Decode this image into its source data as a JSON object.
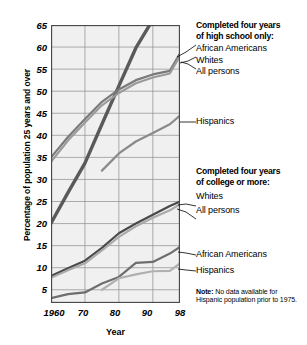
{
  "chart_data": {
    "type": "line",
    "title": "",
    "xlabel": "Year",
    "ylabel": "Percentage of population 25 years and over",
    "xlim": [
      1960,
      1998
    ],
    "ylim": [
      2,
      65
    ],
    "yticks": [
      5,
      10,
      15,
      20,
      25,
      30,
      35,
      40,
      45,
      50,
      55,
      60,
      65
    ],
    "ytick_labels": [
      "5",
      "10",
      "15",
      "20",
      "25",
      "30",
      "35",
      "40",
      "45",
      "50",
      "55",
      "60",
      "65"
    ],
    "xticks": [
      1960,
      1970,
      1980,
      1990,
      1998
    ],
    "xtick_labels": [
      "1960",
      "70",
      "80",
      "90",
      "98"
    ],
    "grid": true,
    "legend_position": "right",
    "groups": [
      {
        "heading": "Completed four years of high school only:",
        "series": [
          {
            "name": "African Americans",
            "color": "#5a5a5a",
            "x": [
              1960,
              1965,
              1970,
              1975,
              1980,
              1985,
              1990,
              1995,
              1998
            ],
            "y": [
              20.1,
              27.0,
              33.7,
              42.5,
              51.2,
              59.8,
              66.2,
              73.8,
              76.0
            ]
          },
          {
            "name": "Whites",
            "color": "#7a7a7a",
            "x": [
              1960,
              1965,
              1970,
              1975,
              1980,
              1985,
              1990,
              1995,
              1998
            ],
            "y": [
              35.0,
              39.6,
              43.7,
              47.6,
              50.4,
              52.5,
              53.8,
              54.6,
              58.6
            ]
          },
          {
            "name": "All persons",
            "color": "#9a9a9a",
            "x": [
              1960,
              1965,
              1970,
              1975,
              1980,
              1985,
              1990,
              1995,
              1998
            ],
            "y": [
              34.0,
              38.8,
              42.9,
              46.8,
              49.6,
              51.8,
              53.1,
              54.0,
              58.0
            ]
          },
          {
            "name": "Hispanics",
            "color": "#8a8a8a",
            "x": [
              1975,
              1980,
              1985,
              1990,
              1995,
              1998
            ],
            "y": [
              32.0,
              35.9,
              38.6,
              40.5,
              42.5,
              44.5
            ]
          }
        ]
      },
      {
        "heading": "Completed four years of college or more:",
        "series": [
          {
            "name": "Whites",
            "color": "#4a4a4a",
            "x": [
              1960,
              1965,
              1970,
              1975,
              1980,
              1985,
              1990,
              1995,
              1998
            ],
            "y": [
              8.1,
              9.9,
              11.6,
              14.5,
              17.8,
              20.0,
              22.0,
              24.0,
              25.0
            ]
          },
          {
            "name": "All persons",
            "color": "#aaaaaa",
            "x": [
              1960,
              1965,
              1970,
              1975,
              1980,
              1985,
              1990,
              1995,
              1998
            ],
            "y": [
              7.7,
              9.4,
              11.0,
              13.9,
              17.0,
              19.4,
              21.3,
              23.0,
              24.4
            ]
          },
          {
            "name": "African Americans",
            "color": "#6e6e6e",
            "x": [
              1960,
              1965,
              1970,
              1975,
              1980,
              1985,
              1990,
              1995,
              1998
            ],
            "y": [
              3.1,
              4.0,
              4.4,
              6.4,
              7.9,
              11.1,
              11.3,
              13.2,
              14.7
            ]
          },
          {
            "name": "Hispanics",
            "color": "#b0b0b0",
            "x": [
              1975,
              1980,
              1985,
              1990,
              1995,
              1998
            ],
            "y": [
              5.0,
              7.6,
              8.5,
              9.2,
              9.3,
              11.0
            ]
          }
        ]
      }
    ],
    "note_label": "Note:",
    "note_text": "No data available for Hispanic population prior to 1975."
  },
  "legend": {
    "hs_heading_line1": "Completed four years",
    "hs_heading_line2": "of high school only:",
    "hs_items": [
      "African Americans",
      "Whites",
      "All persons"
    ],
    "hs_hispanics": "Hispanics",
    "col_heading_line1": "Completed four years",
    "col_heading_line2": "of college or more:",
    "col_items_top": [
      "Whites",
      "All persons"
    ],
    "col_items_bottom": [
      "African Americans",
      "Hispanics"
    ]
  },
  "axes": {
    "ytitle": "Percentage of population 25 years and over",
    "xtitle": "Year",
    "yticks": [
      "65",
      "60",
      "55",
      "50",
      "45",
      "40",
      "35",
      "30",
      "25",
      "20",
      "15",
      "10",
      "5"
    ],
    "xticks": [
      "1960",
      "70",
      "80",
      "90",
      "98"
    ]
  },
  "note": {
    "label": "Note:",
    "text": "No data available for Hispanic population prior to 1975."
  },
  "colors": {
    "background": "#ffffff",
    "plot_background": "#f0f0f0",
    "grid": "#8d8d8d",
    "axis": "#4a4a4a",
    "text": "#000000"
  }
}
